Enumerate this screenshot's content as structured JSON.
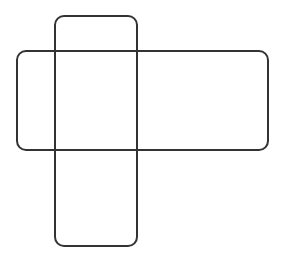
{
  "diagram": {
    "type": "net-of-shapes",
    "canvas": {
      "width": 281,
      "height": 255,
      "background": "#ffffff"
    },
    "stroke": {
      "color": "#333333",
      "width": 2
    },
    "shapes": [
      {
        "id": "horizontal-rect",
        "x": 17,
        "y": 51,
        "width": 251,
        "height": 99,
        "radius": 9
      },
      {
        "id": "vertical-rect",
        "x": 55,
        "y": 16,
        "width": 82,
        "height": 230,
        "radius": 9
      }
    ]
  }
}
